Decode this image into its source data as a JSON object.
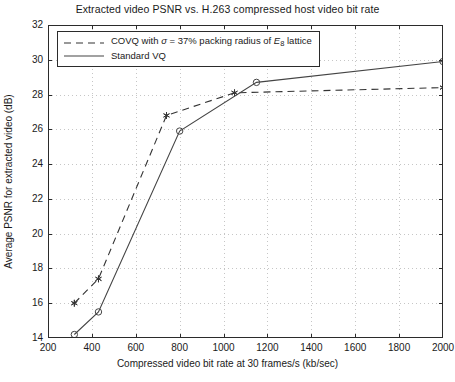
{
  "chart_data": {
    "type": "line",
    "title": "Extracted video PSNR vs. H.263 compressed host video bit rate",
    "xlabel": "Compressed video bit rate at 30 frames/s (kb/sec)",
    "ylabel": "Average PSNR for extracted video (dB)",
    "xlim": [
      200,
      2000
    ],
    "ylim": [
      14,
      32
    ],
    "xticks": [
      200,
      400,
      600,
      800,
      1000,
      1200,
      1400,
      1600,
      1800,
      2000
    ],
    "yticks": [
      14,
      16,
      18,
      20,
      22,
      24,
      26,
      28,
      30,
      32
    ],
    "grid": true,
    "legend_position": "upper-left",
    "series": [
      {
        "name": "COVQ with σ = 37% packing radius of E₈ lattice",
        "style": "dashed",
        "marker": "asterisk",
        "color": "#333333",
        "x": [
          320,
          430,
          740,
          1050,
          2000
        ],
        "y": [
          16.0,
          17.4,
          26.8,
          28.1,
          28.4
        ]
      },
      {
        "name": "Standard VQ",
        "style": "solid",
        "marker": "circle",
        "color": "#444444",
        "x": [
          320,
          430,
          800,
          1150,
          2000
        ],
        "y": [
          14.2,
          15.5,
          25.9,
          28.7,
          29.9
        ]
      }
    ]
  },
  "legend": {
    "entries": [
      {
        "prefix": "COVQ with ",
        "sigma": "σ",
        "middle": " = 37% packing radius of ",
        "lattice_letter": "E",
        "lattice_sub": "8",
        "suffix": " lattice"
      },
      {
        "label": "Standard VQ"
      }
    ]
  }
}
